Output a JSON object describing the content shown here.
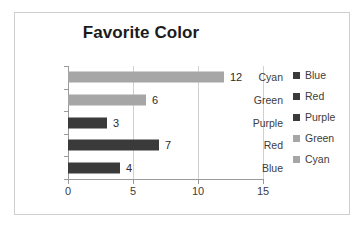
{
  "chart_data": {
    "type": "bar",
    "orientation": "horizontal",
    "title": "Favorite Color",
    "xlabel": "",
    "ylabel": "",
    "categories": [
      "Blue",
      "Red",
      "Purple",
      "Green",
      "Cyan"
    ],
    "values": [
      4,
      7,
      3,
      6,
      12
    ],
    "data_labels": [
      "4",
      "7",
      "3",
      "6",
      "12"
    ],
    "display_order_top_to_bottom": [
      "Cyan",
      "Green",
      "Purple",
      "Red",
      "Blue"
    ],
    "xlim": [
      0,
      15
    ],
    "xticks": [
      "0",
      "5",
      "10",
      "15"
    ],
    "grid": "vertical",
    "legend_position": "right",
    "legend": [
      {
        "label": "Blue",
        "color": "#3a3a3a"
      },
      {
        "label": "Red",
        "color": "#3a3a3a"
      },
      {
        "label": "Purple",
        "color": "#3a3a3a"
      },
      {
        "label": "Green",
        "color": "#a6a6a6"
      },
      {
        "label": "Cyan",
        "color": "#a6a6a6"
      }
    ],
    "bars_top_to_bottom": [
      {
        "category": "Cyan",
        "value": 12,
        "label": "12",
        "color": "#a6a6a6"
      },
      {
        "category": "Green",
        "value": 6,
        "label": "6",
        "color": "#a6a6a6"
      },
      {
        "category": "Purple",
        "value": 3,
        "label": "3",
        "color": "#3a3a3a"
      },
      {
        "category": "Red",
        "value": 7,
        "label": "7",
        "color": "#3a3a3a"
      },
      {
        "category": "Blue",
        "value": 4,
        "label": "4",
        "color": "#3a3a3a"
      }
    ],
    "colors": {
      "bar_dark": "#3a3a3a",
      "bar_light": "#a6a6a6",
      "axis": "#9a9a9a",
      "gridline": "#d0d0d0",
      "frame": "#cfcfcf",
      "text": "#3c3c3c",
      "title_text": "#1b1b1b",
      "background": "#ffffff"
    }
  }
}
